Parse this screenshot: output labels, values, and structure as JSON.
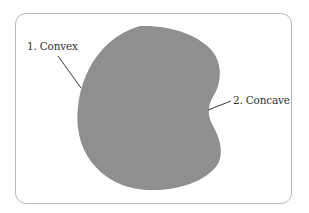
{
  "diagram": {
    "shape_color": "#8f8f8f",
    "line_color": "#3a3a3a",
    "labels": [
      {
        "id": "convex",
        "text": "1. Convex"
      },
      {
        "id": "concave",
        "text": "2. Concave"
      }
    ]
  }
}
